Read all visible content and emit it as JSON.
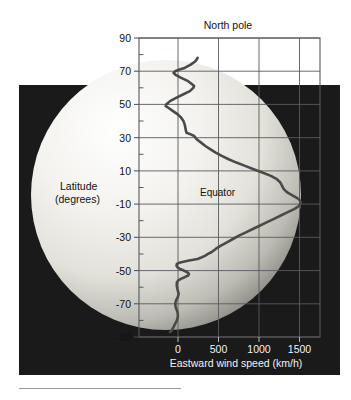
{
  "figure": {
    "title": "North pole",
    "inline_labels": [
      {
        "name": "equator-label",
        "text": "Equator"
      }
    ],
    "y_axis_title_line1": "Latitude",
    "y_axis_title_line2": "(degrees)",
    "x_axis_title": "Eastward wind speed (km/h)",
    "background_color": "#ffffff",
    "panel_color": "#1a1a1a",
    "grid_color": "#55555a",
    "curve_color": "#4a4a4a",
    "planet_light": "#f1f0ec",
    "planet_dark": "#8d8c86"
  },
  "chart_data": {
    "type": "line",
    "title": "North pole",
    "xlabel": "Eastward wind speed (km/h)",
    "ylabel": "Latitude (degrees)",
    "xlim": [
      -300,
      1800
    ],
    "ylim": [
      -90,
      90
    ],
    "grid": true,
    "legend": "none",
    "x_ticks": [
      0,
      500,
      1000,
      1500
    ],
    "x_tick_labels": [
      "0",
      "500",
      "1000",
      "1500"
    ],
    "x_gridlines": [
      0,
      500,
      1000,
      1500
    ],
    "y_ticks": [
      90,
      70,
      50,
      30,
      10,
      -10,
      -30,
      -50,
      -70,
      -90
    ],
    "y_tick_labels": [
      "90",
      "70",
      "50",
      "30",
      "10",
      "-10",
      "-30",
      "-50",
      "-70",
      "-90"
    ],
    "y_minor_ticks": [
      80,
      60,
      40,
      20,
      0,
      -20,
      -40,
      -60,
      -80
    ],
    "y_gridlines": [
      70,
      50,
      30,
      10,
      -10,
      -30,
      -50,
      -70
    ],
    "annotations": [
      {
        "text": "Equator",
        "x": 600,
        "y": 0
      }
    ],
    "series": [
      {
        "name": "Eastward wind speed",
        "units": "km/h",
        "points": [
          [
            380,
            78
          ],
          [
            355,
            76
          ],
          [
            300,
            74
          ],
          [
            230,
            72
          ],
          [
            170,
            71
          ],
          [
            120,
            70
          ],
          [
            100,
            69
          ],
          [
            120,
            68
          ],
          [
            190,
            66
          ],
          [
            270,
            64
          ],
          [
            320,
            62
          ],
          [
            340,
            61
          ],
          [
            330,
            60
          ],
          [
            290,
            58
          ],
          [
            210,
            56
          ],
          [
            130,
            54
          ],
          [
            60,
            52
          ],
          [
            15,
            50
          ],
          [
            10,
            49
          ],
          [
            40,
            48
          ],
          [
            95,
            46
          ],
          [
            150,
            44
          ],
          [
            190,
            42
          ],
          [
            215,
            40
          ],
          [
            230,
            38
          ],
          [
            238,
            36
          ],
          [
            245,
            34
          ],
          [
            252,
            33
          ],
          [
            300,
            32
          ],
          [
            340,
            31
          ],
          [
            370,
            29
          ],
          [
            420,
            27
          ],
          [
            470,
            25
          ],
          [
            530,
            23
          ],
          [
            590,
            21
          ],
          [
            660,
            19
          ],
          [
            740,
            17
          ],
          [
            830,
            15
          ],
          [
            930,
            13
          ],
          [
            1030,
            11
          ],
          [
            1130,
            9
          ],
          [
            1230,
            7
          ],
          [
            1300,
            5
          ],
          [
            1340,
            3
          ],
          [
            1360,
            1
          ],
          [
            1380,
            -1
          ],
          [
            1420,
            -3
          ],
          [
            1490,
            -5
          ],
          [
            1555,
            -7
          ],
          [
            1580,
            -9
          ],
          [
            1560,
            -11
          ],
          [
            1500,
            -13
          ],
          [
            1420,
            -15
          ],
          [
            1340,
            -17
          ],
          [
            1260,
            -19
          ],
          [
            1180,
            -21
          ],
          [
            1100,
            -23
          ],
          [
            1020,
            -25
          ],
          [
            940,
            -27
          ],
          [
            860,
            -29
          ],
          [
            790,
            -31
          ],
          [
            720,
            -33
          ],
          [
            650,
            -35
          ],
          [
            590,
            -37
          ],
          [
            540,
            -39
          ],
          [
            500,
            -40
          ],
          [
            470,
            -41
          ],
          [
            430,
            -42
          ],
          [
            380,
            -43
          ],
          [
            330,
            -43.5
          ],
          [
            280,
            -44
          ],
          [
            230,
            -44.5
          ],
          [
            190,
            -45
          ],
          [
            160,
            -45.5
          ],
          [
            140,
            -46
          ],
          [
            135,
            -47
          ],
          [
            145,
            -48
          ],
          [
            175,
            -49
          ],
          [
            220,
            -50
          ],
          [
            260,
            -51
          ],
          [
            280,
            -52
          ],
          [
            270,
            -53
          ],
          [
            230,
            -54
          ],
          [
            185,
            -55
          ],
          [
            155,
            -56
          ],
          [
            140,
            -57
          ],
          [
            138,
            -59
          ],
          [
            145,
            -61
          ],
          [
            155,
            -63
          ],
          [
            160,
            -64
          ],
          [
            150,
            -66
          ],
          [
            130,
            -68
          ],
          [
            120,
            -70
          ],
          [
            125,
            -72
          ],
          [
            140,
            -74
          ],
          [
            150,
            -76
          ],
          [
            150,
            -78
          ],
          [
            140,
            -80
          ],
          [
            120,
            -82
          ],
          [
            100,
            -84
          ],
          [
            80,
            -86
          ],
          [
            60,
            -87
          ]
        ]
      }
    ]
  }
}
